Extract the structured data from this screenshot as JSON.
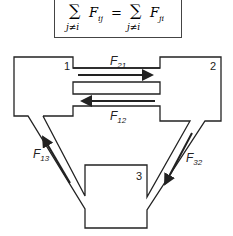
{
  "equation": {
    "lhs_sum_symbol": "∑",
    "lhs_sum_index": "j≠i",
    "lhs_term": "F",
    "lhs_term_sub": "ij",
    "equals": "=",
    "rhs_sum_symbol": "∑",
    "rhs_sum_index": "j≠i",
    "rhs_term": "F",
    "rhs_term_sub": "ji"
  },
  "nodes": [
    {
      "id": "1",
      "label": "1"
    },
    {
      "id": "2",
      "label": "2"
    },
    {
      "id": "3",
      "label": "3"
    }
  ],
  "flows": [
    {
      "label": "F",
      "sub": "21",
      "from": "1",
      "to": "2"
    },
    {
      "label": "F",
      "sub": "12",
      "from": "2",
      "to": "1"
    },
    {
      "label": "F",
      "sub": "13",
      "from": "3",
      "to": "1"
    },
    {
      "label": "F",
      "sub": "32",
      "from": "2",
      "to": "3"
    }
  ],
  "colors": {
    "stroke": "#222222",
    "background": "#ffffff"
  }
}
